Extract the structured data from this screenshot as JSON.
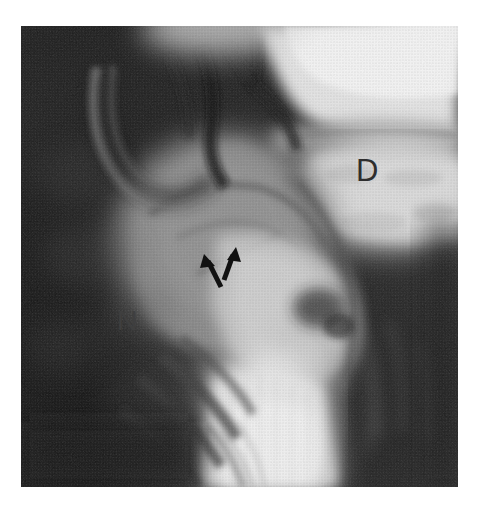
{
  "image": {
    "kind": "grayscale-radiograph",
    "modality_appearance": "plain film radiograph, halftone print reproduction",
    "frame": {
      "left": 21,
      "top": 26,
      "width": 437,
      "height": 461
    },
    "background_color": "#ffffff",
    "darkest_tone": "#0d0d0d",
    "brightest_tone": "#f8f8f8",
    "midtone": "#8a8a8a"
  },
  "annotations": {
    "labels": [
      {
        "id": "label-d",
        "text": "D",
        "x": 356,
        "y": 155,
        "font_size": 31,
        "color": "#2e2e2e",
        "region": "bright upper-right structure"
      },
      {
        "id": "label-n",
        "text": "N",
        "x": 117,
        "y": 307,
        "font_size": 28,
        "color": "#3f3f3f",
        "region": "dark left field"
      }
    ],
    "arrows": [
      {
        "id": "arrow-left",
        "color": "#111111",
        "direction": "up-left",
        "tip_x": 205,
        "tip_y": 257,
        "tail_x": 221,
        "tail_y": 287,
        "shaft_width": 5
      },
      {
        "id": "arrow-right",
        "color": "#111111",
        "direction": "up-right",
        "tip_x": 236,
        "tip_y": 249,
        "tail_x": 224,
        "tail_y": 280,
        "shaft_width": 5
      }
    ]
  },
  "tones": {
    "regions": [
      {
        "name": "upper-left-dark-field",
        "value": "#1c1c1c"
      },
      {
        "name": "upper-right-bright-field",
        "value": "#ececec"
      },
      {
        "name": "central-mid-gray-tissue",
        "value": "#8d8d8d"
      },
      {
        "name": "lower-center-bright-band",
        "value": "#eeeeee"
      },
      {
        "name": "lower-left-dark-field",
        "value": "#191919"
      },
      {
        "name": "lower-right-dark-field",
        "value": "#2a2a2a"
      }
    ]
  }
}
